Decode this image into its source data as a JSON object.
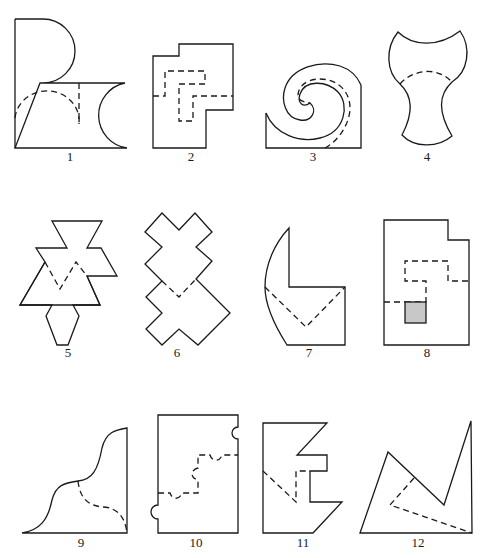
{
  "figures": [
    {
      "id": 1,
      "label": "1",
      "label_pos": [
        70,
        157
      ]
    },
    {
      "id": 2,
      "label": "2",
      "label_pos": [
        191,
        157
      ]
    },
    {
      "id": 3,
      "label": "3",
      "label_pos": [
        313,
        157
      ]
    },
    {
      "id": 4,
      "label": "4",
      "label_pos": [
        427,
        157
      ]
    },
    {
      "id": 5,
      "label": "5",
      "label_pos": [
        68,
        352
      ]
    },
    {
      "id": 6,
      "label": "6",
      "label_pos": [
        177,
        352
      ]
    },
    {
      "id": 7,
      "label": "7",
      "label_pos": [
        309,
        352
      ]
    },
    {
      "id": 8,
      "label": "8",
      "label_pos": [
        427,
        352
      ]
    },
    {
      "id": 9,
      "label": "9",
      "label_pos": [
        81,
        540
      ]
    },
    {
      "id": 10,
      "label": "10",
      "label_pos": [
        196,
        540
      ]
    },
    {
      "id": 11,
      "label": "11",
      "label_pos": [
        303,
        540
      ]
    },
    {
      "id": 12,
      "label": "12",
      "label_pos": [
        418,
        540
      ]
    }
  ],
  "colors": {
    "stroke": "#1a1a1a",
    "shaded_square": "#c8c8c8",
    "background": "#ffffff"
  }
}
